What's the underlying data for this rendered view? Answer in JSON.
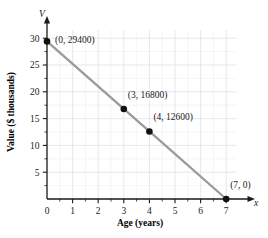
{
  "chart_data": {
    "type": "line",
    "title": "",
    "xlabel": "Age (years)",
    "ylabel": "Value ($ thousands)",
    "x_axis_variable": "x",
    "y_axis_variable": "V",
    "xlim": [
      0,
      7.4
    ],
    "ylim": [
      0,
      31.5
    ],
    "x_ticks": [
      "0",
      "1",
      "2",
      "3",
      "4",
      "5",
      "6",
      "7"
    ],
    "x_tick_values": [
      0,
      1,
      2,
      3,
      4,
      5,
      6,
      7
    ],
    "y_ticks": [
      "5",
      "10",
      "15",
      "20",
      "25",
      "30"
    ],
    "y_tick_values": [
      5,
      10,
      15,
      20,
      25,
      30
    ],
    "x_minor_step": 0.5,
    "y_minor_step": 2.5,
    "grid": true,
    "grid_color": "#dfe3ea",
    "legend": "none",
    "line_color": "#9a9a9a",
    "marker_color": "#111111",
    "series": [
      {
        "name": "Value of asset",
        "x": [
          0,
          3,
          4,
          7
        ],
        "y": [
          29.4,
          16.8,
          12.6,
          0
        ],
        "points": [
          {
            "label": "(0, 29400)",
            "x": 0,
            "y": 29.4,
            "dx": 8,
            "dy": 0.3
          },
          {
            "label": "(3, 16800)",
            "x": 3,
            "y": 16.8,
            "dx": 4,
            "dy": 2.7
          },
          {
            "label": "(4, 12600)",
            "x": 4,
            "y": 12.6,
            "dx": 4,
            "dy": 2.8
          },
          {
            "label": "(7, 0)",
            "x": 7,
            "y": 0,
            "dx": 4,
            "dy": 2.6
          }
        ]
      }
    ],
    "annotations": [
      "(0, 29400)",
      "(3, 16800)",
      "(4, 12600)",
      "(7, 0)"
    ]
  }
}
